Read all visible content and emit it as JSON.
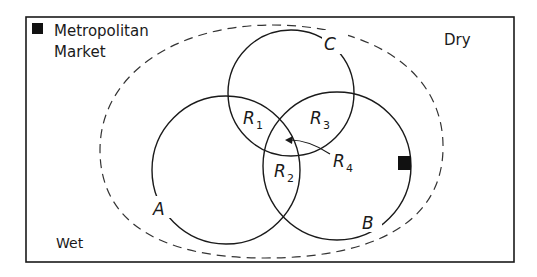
{
  "diagram": {
    "legend": {
      "marker": "filled-square",
      "line1": "Metropolitan",
      "line2": "Market"
    },
    "corner_labels": {
      "top_right": "Dry",
      "bottom_left": "Wet"
    },
    "circles": [
      {
        "id": "A",
        "label": "A"
      },
      {
        "id": "B",
        "label": "B"
      },
      {
        "id": "C",
        "label": "C"
      }
    ],
    "regions": [
      {
        "id": "R1",
        "letter": "R",
        "sub": "1"
      },
      {
        "id": "R2",
        "letter": "R",
        "sub": "2"
      },
      {
        "id": "R3",
        "letter": "R",
        "sub": "3"
      },
      {
        "id": "R4",
        "letter": "R",
        "sub": "4"
      }
    ],
    "boundary": "dashed-ellipse",
    "market_marker": "filled-square on circle B"
  }
}
